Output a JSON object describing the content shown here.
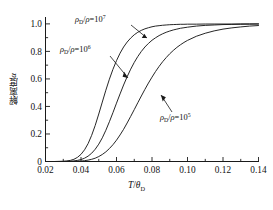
{
  "figure": {
    "background": "#ffffff",
    "line_color": "#1a1a1a"
  },
  "axes": {
    "x_label_main": "T",
    "x_label_slash": "/",
    "x_label_theta": "θ",
    "x_label_sub": "D",
    "y_label_text": "解离度",
    "y_label_symbol": "α",
    "x_ticks": [
      "0.02",
      "0.04",
      "0.06",
      "0.08",
      "0.10",
      "0.12",
      "0.14"
    ],
    "y_ticks": [
      "0",
      "0.2",
      "0.4",
      "0.6",
      "0.8",
      "1.0"
    ],
    "xlim": [
      0.02,
      0.14
    ],
    "ylim": [
      0.0,
      1.05
    ],
    "x_minor_per_major": 2,
    "y_minor_per_major": 2
  },
  "annotations": [
    {
      "id": "label-rho-1e7",
      "rho": "ρ",
      "sub": "D",
      "slash": "/",
      "rho2": "ρ",
      "eq": "=10",
      "exp": "7",
      "x": 75,
      "y": 22,
      "leader": "M 131 25 L 147 38",
      "arrow": "M 147 38 l -5.2 0.1 l 2.6 -4.4 z"
    },
    {
      "id": "label-rho-1e6",
      "rho": "ρ",
      "sub": "D",
      "slash": "/",
      "rho2": "ρ",
      "eq": "=10",
      "exp": "6",
      "x": 60,
      "y": 52,
      "leader": "M 110 56 L 128 78",
      "arrow": "M 128 78 l -5.4 -1.3 l 1.6 -4.9 z"
    },
    {
      "id": "label-rho-1e5",
      "rho": "ρ",
      "sub": "D",
      "slash": "/",
      "rho2": "ρ",
      "eq": "=10",
      "exp": "5",
      "x": 160,
      "y": 120,
      "leader": "M 172 112 L 161 95",
      "arrow": "M 161 95 l 4.9 2.3 l -3.2 4.2 z"
    }
  ],
  "chart_data": {
    "type": "line",
    "title": "",
    "xlabel": "T/θ_D",
    "ylabel": "解离度 α",
    "xlim": [
      0.02,
      0.14
    ],
    "ylim": [
      0.0,
      1.05
    ],
    "grid": false,
    "legend": "inline-annotations",
    "x": [
      0.02,
      0.025,
      0.03,
      0.032,
      0.034,
      0.036,
      0.038,
      0.04,
      0.042,
      0.044,
      0.046,
      0.048,
      0.05,
      0.052,
      0.054,
      0.056,
      0.058,
      0.06,
      0.062,
      0.064,
      0.066,
      0.068,
      0.07,
      0.072,
      0.074,
      0.076,
      0.078,
      0.08,
      0.082,
      0.084,
      0.086,
      0.088,
      0.09,
      0.092,
      0.094,
      0.096,
      0.098,
      0.1,
      0.105,
      0.11,
      0.115,
      0.12,
      0.125,
      0.13,
      0.135,
      0.14
    ],
    "series": [
      {
        "name": "ρ_D/ρ=10^7",
        "midpoint_x": 0.0565,
        "values": [
          0.0,
          0.0,
          0.002,
          0.004,
          0.008,
          0.016,
          0.03,
          0.052,
          0.085,
          0.13,
          0.19,
          0.262,
          0.345,
          0.432,
          0.518,
          0.598,
          0.67,
          0.733,
          0.787,
          0.832,
          0.868,
          0.897,
          0.921,
          0.939,
          0.953,
          0.964,
          0.972,
          0.979,
          0.984,
          0.987,
          0.99,
          0.992,
          0.994,
          0.995,
          0.996,
          0.997,
          0.997,
          0.998,
          0.998,
          0.999,
          0.999,
          0.999,
          0.999,
          1.0,
          1.0,
          1.0
        ]
      },
      {
        "name": "ρ_D/ρ=10^6",
        "midpoint_x": 0.0667,
        "values": [
          0.0,
          0.0,
          0.0,
          0.001,
          0.002,
          0.004,
          0.008,
          0.014,
          0.024,
          0.039,
          0.06,
          0.089,
          0.126,
          0.172,
          0.227,
          0.289,
          0.355,
          0.424,
          0.491,
          0.556,
          0.616,
          0.671,
          0.72,
          0.763,
          0.8,
          0.832,
          0.858,
          0.881,
          0.899,
          0.915,
          0.928,
          0.939,
          0.948,
          0.956,
          0.962,
          0.968,
          0.972,
          0.976,
          0.984,
          0.989,
          0.992,
          0.995,
          0.996,
          0.997,
          0.998,
          0.999
        ]
      },
      {
        "name": "ρ_D/ρ=10^5",
        "midpoint_x": 0.085,
        "values": [
          0.0,
          0.0,
          0.0,
          0.0,
          0.0,
          0.001,
          0.002,
          0.003,
          0.006,
          0.01,
          0.016,
          0.024,
          0.036,
          0.051,
          0.07,
          0.094,
          0.122,
          0.155,
          0.193,
          0.234,
          0.28,
          0.328,
          0.377,
          0.427,
          0.476,
          0.524,
          0.57,
          0.613,
          0.654,
          0.691,
          0.725,
          0.755,
          0.783,
          0.807,
          0.829,
          0.848,
          0.865,
          0.88,
          0.91,
          0.932,
          0.949,
          0.962,
          0.971,
          0.978,
          0.984,
          0.988
        ]
      }
    ]
  }
}
